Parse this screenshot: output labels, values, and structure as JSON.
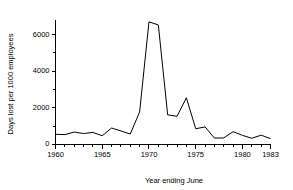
{
  "chart_data": {
    "type": "line",
    "title": "",
    "subtitle": "",
    "xlabel": "Year ending June",
    "ylabel": "Days lost per 1000 employees",
    "xlim": [
      1960,
      1983
    ],
    "ylim": [
      0,
      6800
    ],
    "grid": false,
    "legend": null,
    "legend_position": "none",
    "x_major_ticks": [
      1960,
      1965,
      1970,
      1975,
      1980,
      1983
    ],
    "x_major_tick_labels": [
      "1960",
      "1965",
      "1970",
      "1975",
      "1980",
      "1983"
    ],
    "x_minor_tick_interval": 1,
    "y_major_ticks": [
      0,
      2000,
      4000,
      6000
    ],
    "y_major_tick_labels": [
      "0",
      "2000",
      "4000",
      "6000"
    ],
    "y_minor_ticks": [
      1000,
      3000,
      5000
    ],
    "series": [
      {
        "name": "Days lost per 1000 employees",
        "color": "#000000",
        "x": [
          1960,
          1961,
          1962,
          1963,
          1964,
          1965,
          1966,
          1967,
          1968,
          1969,
          1970,
          1971,
          1972,
          1973,
          1974,
          1975,
          1976,
          1977,
          1978,
          1979,
          1980,
          1981,
          1982,
          1983
        ],
        "values": [
          560,
          540,
          680,
          600,
          660,
          480,
          900,
          740,
          570,
          1780,
          6700,
          6530,
          1620,
          1540,
          2550,
          860,
          960,
          350,
          360,
          700,
          500,
          340,
          510,
          320
        ]
      }
    ]
  },
  "axis_titles": {
    "x": "Year ending June",
    "y": "Days lost per 1000 employees"
  }
}
